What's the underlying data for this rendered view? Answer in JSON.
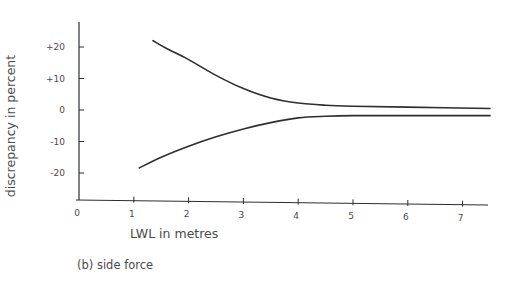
{
  "chart_data": {
    "type": "line",
    "title": "",
    "caption": "(b) side force",
    "xlabel": "LWL in metres",
    "ylabel": "discrepancy in percent",
    "xlim": [
      0,
      7.5
    ],
    "ylim": [
      -29,
      28
    ],
    "x_ticks": [
      0,
      1,
      2,
      3,
      4,
      5,
      6,
      7
    ],
    "x_tick_labels": [
      "0",
      "1",
      "2",
      "3",
      "4",
      "5",
      "6",
      "7"
    ],
    "y_ticks": [
      20,
      10,
      0,
      -10,
      -20
    ],
    "y_tick_labels": [
      "+20",
      "+10",
      "0",
      "-10",
      "-20"
    ],
    "grid": false,
    "legend": null,
    "series": [
      {
        "name": "upper bound",
        "x": [
          1.35,
          1.6,
          2.0,
          2.5,
          3.0,
          3.5,
          4.0,
          4.5,
          5.0,
          6.0,
          7.5
        ],
        "y": [
          22,
          19.5,
          16,
          11,
          6.8,
          3.8,
          2.2,
          1.5,
          1.2,
          0.9,
          0.5
        ]
      },
      {
        "name": "lower bound",
        "x": [
          1.1,
          1.5,
          2.0,
          2.5,
          3.0,
          3.5,
          4.0,
          4.5,
          5.0,
          6.0,
          7.5
        ],
        "y": [
          -18.4,
          -15,
          -11.5,
          -8.5,
          -6,
          -4,
          -2.5,
          -2,
          -1.8,
          -1.8,
          -1.8
        ]
      }
    ],
    "line_color": "#2e2e2e"
  }
}
